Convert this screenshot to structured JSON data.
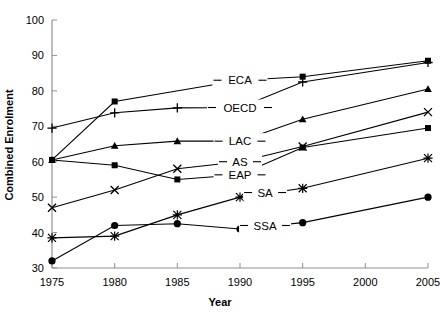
{
  "chart_data": {
    "type": "line",
    "title": "",
    "xlabel": "Year",
    "ylabel": "Combined Enrolment",
    "x": [
      1975,
      1980,
      1985,
      1990,
      1995,
      2000,
      2005
    ],
    "xticks": [
      "1975",
      "1980",
      "1985",
      "1990",
      "1995",
      "2000",
      "2005"
    ],
    "yticks": [
      "30",
      "40",
      "50",
      "60",
      "70",
      "80",
      "90",
      "100"
    ],
    "xlim": [
      1975,
      2005
    ],
    "ylim": [
      30,
      100
    ],
    "grid": false,
    "legend": "inline-labels",
    "series": [
      {
        "name": "ECA",
        "label": "ECA",
        "marker": "square",
        "x": [
          1975,
          1980,
          1985,
          1990,
          1995,
          2000,
          2005
        ],
        "values": [
          60.5,
          77.0,
          null,
          83.0,
          84.0,
          null,
          88.5
        ]
      },
      {
        "name": "OECD",
        "label": "OECD",
        "marker": "plus",
        "x": [
          1975,
          1980,
          1985,
          1990,
          1995,
          2000,
          2005
        ],
        "values": [
          69.5,
          73.8,
          75.2,
          75.3,
          82.5,
          null,
          88.0
        ]
      },
      {
        "name": "LAC",
        "label": "LAC",
        "marker": "triangle",
        "x": [
          1975,
          1980,
          1985,
          1990,
          1995,
          2000,
          2005
        ],
        "values": [
          60.5,
          64.5,
          65.8,
          65.8,
          72.0,
          null,
          80.5
        ]
      },
      {
        "name": "AS",
        "label": "AS",
        "marker": "cross",
        "x": [
          1975,
          1980,
          1985,
          1990,
          1995,
          2000,
          2005
        ],
        "values": [
          47.0,
          52.0,
          58.0,
          60.0,
          64.3,
          null,
          74.0
        ]
      },
      {
        "name": "EAP",
        "label": "EAP",
        "marker": "square",
        "x": [
          1975,
          1980,
          1985,
          1990,
          1995,
          2000,
          2005
        ],
        "values": [
          60.5,
          59.0,
          55.0,
          56.3,
          64.0,
          null,
          69.5
        ]
      },
      {
        "name": "SA",
        "label": "SA",
        "marker": "star",
        "x": [
          1975,
          1980,
          1985,
          1990,
          1995,
          2000,
          2005
        ],
        "values": [
          38.5,
          39.0,
          45.0,
          50.0,
          52.5,
          null,
          61.0
        ]
      },
      {
        "name": "SSA",
        "label": "SSA",
        "marker": "circle",
        "x": [
          1975,
          1980,
          1985,
          1990,
          1995,
          2000,
          2005
        ],
        "values": [
          32.0,
          42.0,
          42.5,
          41.0,
          42.8,
          null,
          50.0
        ]
      }
    ],
    "inline_label_positions": [
      {
        "name": "ECA",
        "x": 1990,
        "y": 83.0
      },
      {
        "name": "OECD",
        "x": 1990,
        "y": 75.3
      },
      {
        "name": "LAC",
        "x": 1990,
        "y": 65.8
      },
      {
        "name": "AS",
        "x": 1990,
        "y": 60.0
      },
      {
        "name": "EAP",
        "x": 1990,
        "y": 56.3
      },
      {
        "name": "SA",
        "x": 1992,
        "y": 51.3
      },
      {
        "name": "SSA",
        "x": 1992,
        "y": 42.0
      }
    ],
    "colors": {
      "line": "#000000",
      "marker": "#000000",
      "axis": "#808080",
      "background": "#ffffff"
    }
  }
}
